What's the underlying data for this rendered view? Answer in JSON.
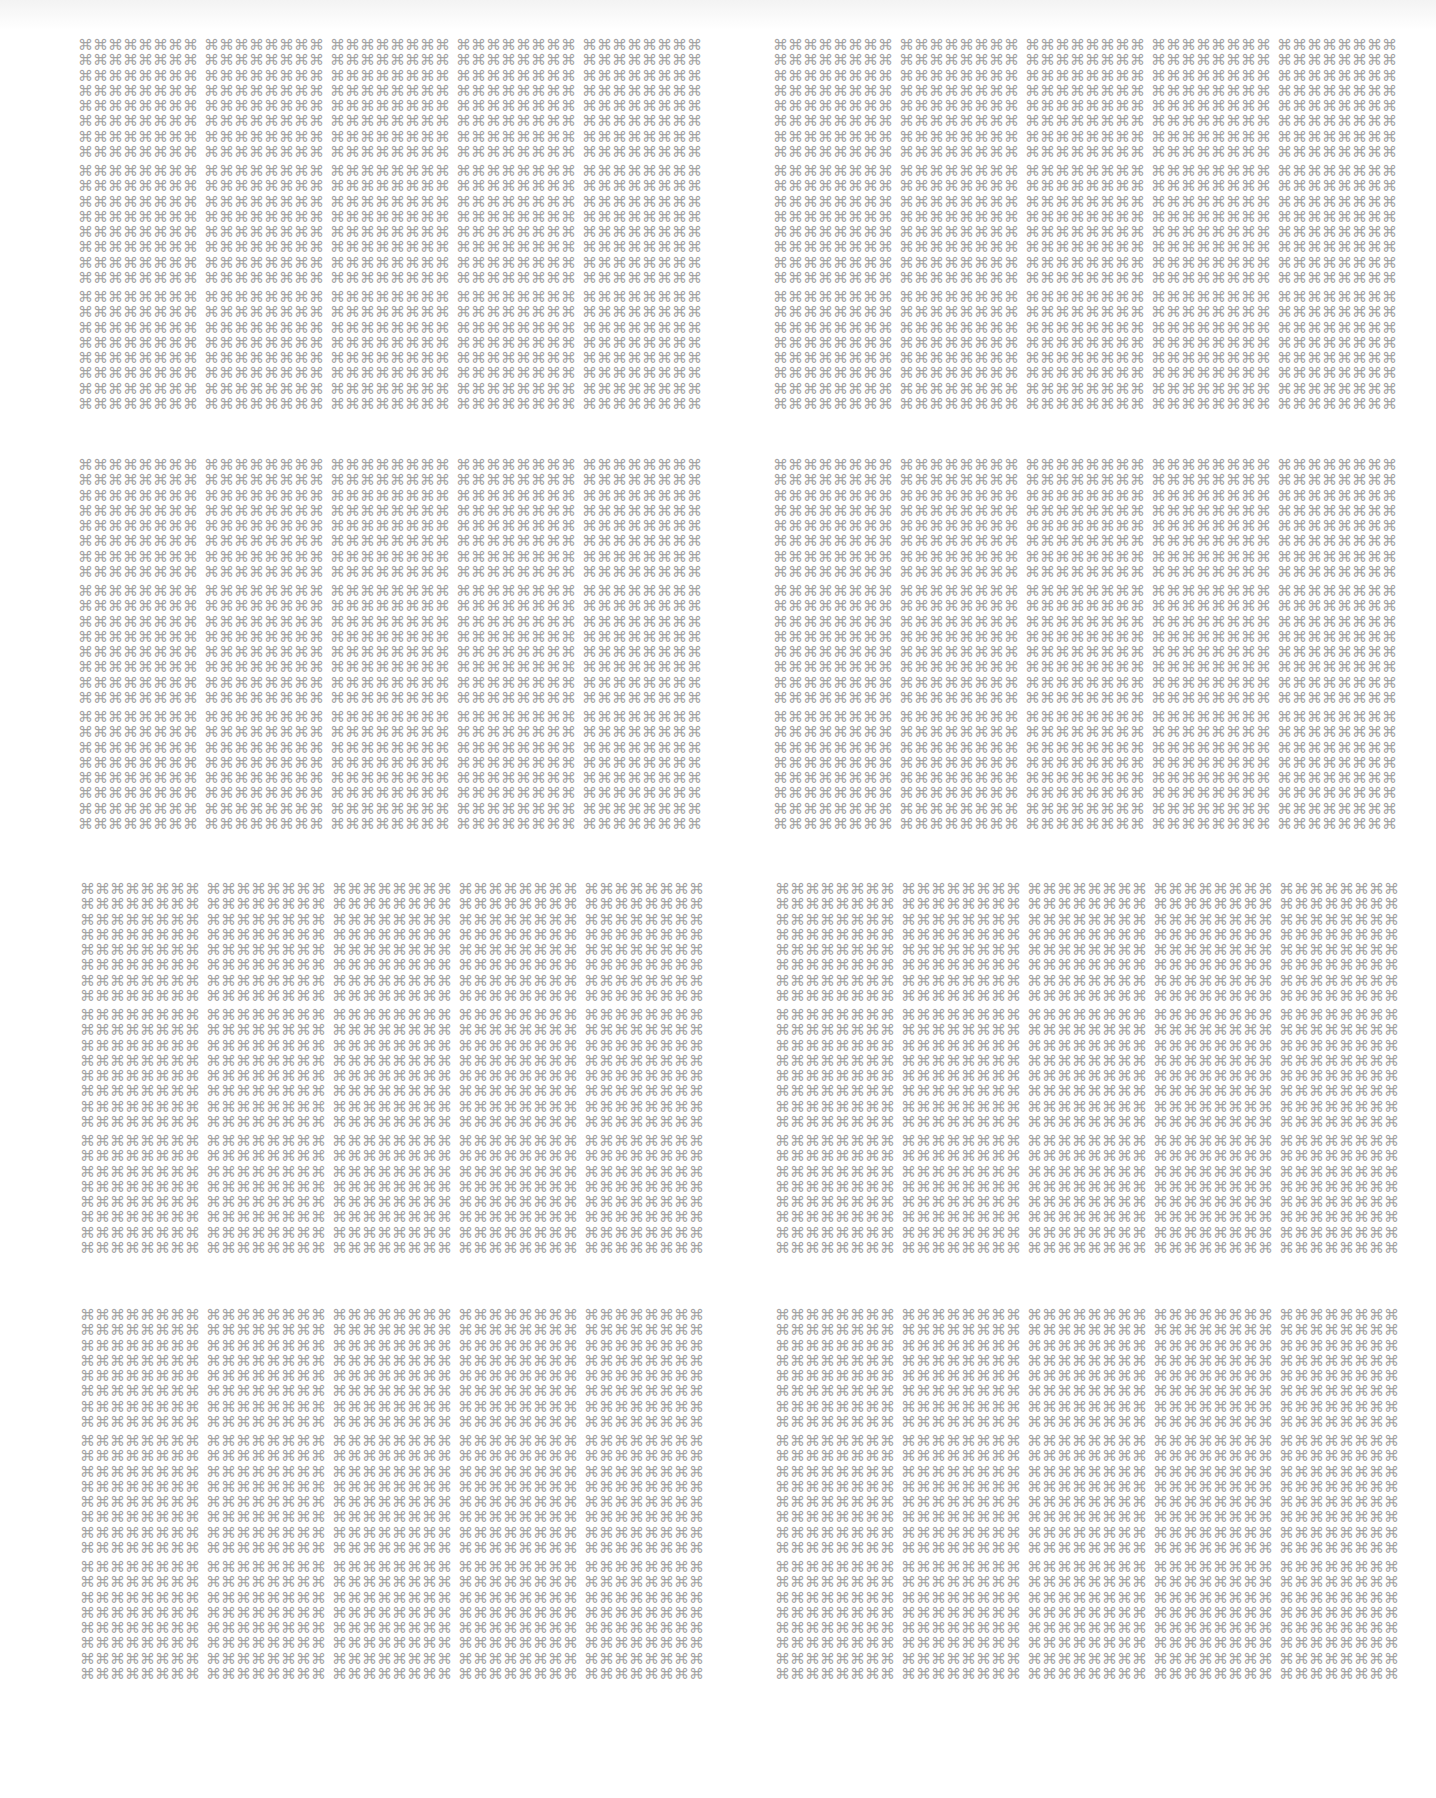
{
  "page": {
    "background": "#ffffff",
    "glyph": "⌘",
    "glyph_icon": "command-key-icon",
    "glyph_color": "#a3a3a3"
  },
  "layout": {
    "block_rows": 4,
    "block_cols": 2,
    "tiles_per_block": {
      "rows": 3,
      "cols": 5
    },
    "glyphs_per_tile": {
      "rows": 8,
      "cols": 8
    }
  },
  "blocks": [
    {
      "left": 78,
      "top": 38
    },
    {
      "left": 773,
      "top": 38
    },
    {
      "left": 78,
      "top": 458
    },
    {
      "left": 773,
      "top": 458
    },
    {
      "left": 80,
      "top": 882
    },
    {
      "left": 775,
      "top": 882
    },
    {
      "left": 80,
      "top": 1308
    },
    {
      "left": 775,
      "top": 1308
    }
  ]
}
